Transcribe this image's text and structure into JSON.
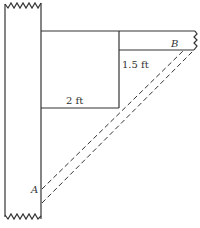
{
  "diagram": {
    "labels": {
      "point_a": "A",
      "point_b": "B",
      "vertical_dim": "1.5 ft",
      "horizontal_dim": "2 ft"
    },
    "colors": {
      "line": "#333333",
      "background": "#ffffff"
    }
  }
}
